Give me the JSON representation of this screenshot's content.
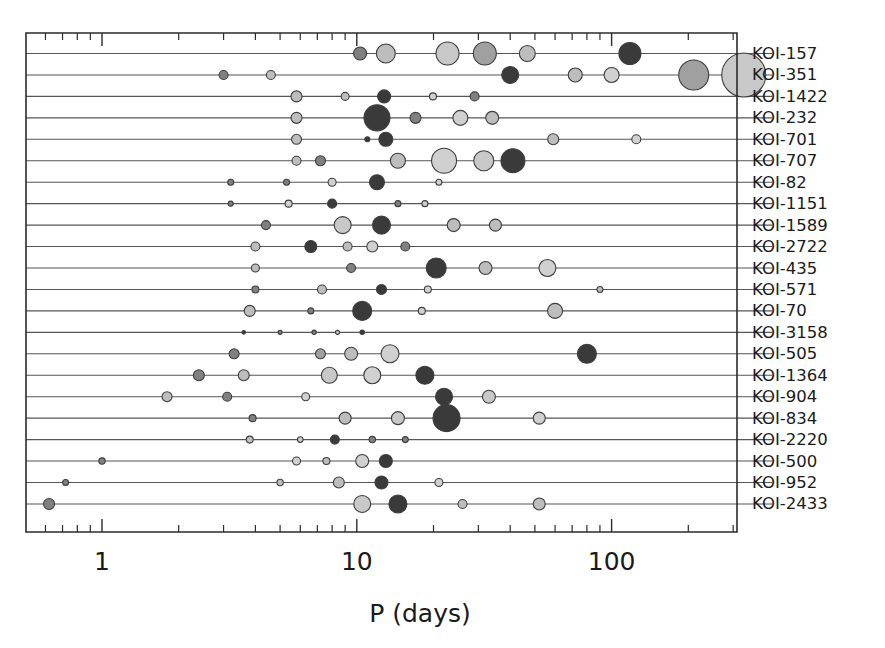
{
  "chart_data": {
    "type": "scatter",
    "title": "",
    "xlabel": "P (days)",
    "ylabel": "",
    "xscale": "log",
    "xlim": [
      0.55,
      1300
    ],
    "xticks": [
      1,
      10,
      100,
      1000
    ],
    "xticklabels": [
      "1",
      "10",
      "100",
      "1000"
    ],
    "grid": false,
    "legend": false,
    "marker_note": "Circle area scales with planet radius; fill gray level encodes planet radius class (light gray = large, dark = small/rocky).",
    "colors": {
      "axis": "#2b2b2b",
      "system_line": "#555555",
      "marker_edge": "#3d3d3d",
      "fill_light": "#d0d0d0",
      "fill_midlight": "#bdbdbd",
      "fill_mid": "#a0a0a0",
      "fill_middark": "#808080",
      "fill_dark": "#3a3a3a",
      "background": "#ffffff"
    },
    "categories": [
      "KOI-157",
      "KOI-351",
      "KOI-1422",
      "KOI-232",
      "KOI-701",
      "KOI-707",
      "KOI-82",
      "KOI-1151",
      "KOI-1589",
      "KOI-2722",
      "KOI-435",
      "KOI-571",
      "KOI-70",
      "KOI-3158",
      "KOI-505",
      "KOI-1364",
      "KOI-904",
      "KOI-834",
      "KOI-2220",
      "KOI-500",
      "KOI-952",
      "KOI-2433"
    ],
    "series": [
      {
        "name": "KOI-157",
        "planets": [
          {
            "P": 10.3,
            "r": 6.5,
            "fill": "#808080"
          },
          {
            "P": 13.0,
            "r": 9.5,
            "fill": "#bdbdbd"
          },
          {
            "P": 22.7,
            "r": 11.5,
            "fill": "#c8c8c8"
          },
          {
            "P": 31.8,
            "r": 11.5,
            "fill": "#a0a0a0"
          },
          {
            "P": 46.7,
            "r": 8.0,
            "fill": "#bdbdbd"
          },
          {
            "P": 118.0,
            "r": 11.0,
            "fill": "#3a3a3a"
          }
        ]
      },
      {
        "name": "KOI-351",
        "planets": [
          {
            "P": 3.0,
            "r": 4.5,
            "fill": "#808080"
          },
          {
            "P": 4.6,
            "r": 4.5,
            "fill": "#bdbdbd"
          },
          {
            "P": 40.0,
            "r": 8.5,
            "fill": "#3a3a3a"
          },
          {
            "P": 72.0,
            "r": 7.0,
            "fill": "#bdbdbd"
          },
          {
            "P": 100.0,
            "r": 7.5,
            "fill": "#d0d0d0"
          },
          {
            "P": 210.0,
            "r": 15.0,
            "fill": "#a0a0a0"
          },
          {
            "P": 330.0,
            "r": 22.0,
            "fill": "#c8c8c8"
          }
        ]
      },
      {
        "name": "KOI-1422",
        "planets": [
          {
            "P": 5.8,
            "r": 5.5,
            "fill": "#bdbdbd"
          },
          {
            "P": 9.0,
            "r": 4.0,
            "fill": "#bdbdbd"
          },
          {
            "P": 12.8,
            "r": 6.5,
            "fill": "#3a3a3a"
          },
          {
            "P": 19.9,
            "r": 3.5,
            "fill": "#d0d0d0"
          },
          {
            "P": 29.0,
            "r": 4.5,
            "fill": "#808080"
          }
        ]
      },
      {
        "name": "KOI-232",
        "planets": [
          {
            "P": 5.8,
            "r": 5.5,
            "fill": "#bdbdbd"
          },
          {
            "P": 12.0,
            "r": 13.0,
            "fill": "#3a3a3a"
          },
          {
            "P": 17.0,
            "r": 5.5,
            "fill": "#808080"
          },
          {
            "P": 25.5,
            "r": 7.5,
            "fill": "#d0d0d0"
          },
          {
            "P": 34.0,
            "r": 6.5,
            "fill": "#bdbdbd"
          }
        ]
      },
      {
        "name": "KOI-701",
        "planets": [
          {
            "P": 5.8,
            "r": 5.0,
            "fill": "#bdbdbd"
          },
          {
            "P": 11.0,
            "r": 2.5,
            "fill": "#3a3a3a"
          },
          {
            "P": 13.0,
            "r": 7.0,
            "fill": "#3a3a3a"
          },
          {
            "P": 59.0,
            "r": 5.5,
            "fill": "#bdbdbd"
          },
          {
            "P": 125.0,
            "r": 4.5,
            "fill": "#d0d0d0"
          }
        ]
      },
      {
        "name": "KOI-707",
        "planets": [
          {
            "P": 5.8,
            "r": 4.5,
            "fill": "#bdbdbd"
          },
          {
            "P": 7.2,
            "r": 5.0,
            "fill": "#808080"
          },
          {
            "P": 14.5,
            "r": 7.5,
            "fill": "#bdbdbd"
          },
          {
            "P": 22.0,
            "r": 12.5,
            "fill": "#d0d0d0"
          },
          {
            "P": 31.5,
            "r": 10.0,
            "fill": "#c8c8c8"
          },
          {
            "P": 41.0,
            "r": 12.0,
            "fill": "#3a3a3a"
          }
        ]
      },
      {
        "name": "KOI-82",
        "planets": [
          {
            "P": 3.2,
            "r": 3.0,
            "fill": "#808080"
          },
          {
            "P": 5.3,
            "r": 3.0,
            "fill": "#808080"
          },
          {
            "P": 8.0,
            "r": 4.0,
            "fill": "#d0d0d0"
          },
          {
            "P": 12.0,
            "r": 7.5,
            "fill": "#3a3a3a"
          },
          {
            "P": 21.0,
            "r": 3.0,
            "fill": "#d0d0d0"
          }
        ]
      },
      {
        "name": "KOI-1151",
        "planets": [
          {
            "P": 3.2,
            "r": 2.5,
            "fill": "#808080"
          },
          {
            "P": 5.4,
            "r": 3.5,
            "fill": "#d0d0d0"
          },
          {
            "P": 8.0,
            "r": 4.5,
            "fill": "#3a3a3a"
          },
          {
            "P": 14.5,
            "r": 3.0,
            "fill": "#808080"
          },
          {
            "P": 18.5,
            "r": 3.0,
            "fill": "#d0d0d0"
          }
        ]
      },
      {
        "name": "KOI-1589",
        "planets": [
          {
            "P": 4.4,
            "r": 4.5,
            "fill": "#808080"
          },
          {
            "P": 8.8,
            "r": 8.5,
            "fill": "#c8c8c8"
          },
          {
            "P": 12.5,
            "r": 9.0,
            "fill": "#3a3a3a"
          },
          {
            "P": 24.0,
            "r": 6.5,
            "fill": "#bdbdbd"
          },
          {
            "P": 35.0,
            "r": 6.0,
            "fill": "#bdbdbd"
          }
        ]
      },
      {
        "name": "KOI-2722",
        "planets": [
          {
            "P": 4.0,
            "r": 4.5,
            "fill": "#bdbdbd"
          },
          {
            "P": 6.6,
            "r": 6.0,
            "fill": "#3a3a3a"
          },
          {
            "P": 9.2,
            "r": 4.5,
            "fill": "#bdbdbd"
          },
          {
            "P": 11.5,
            "r": 5.5,
            "fill": "#d0d0d0"
          },
          {
            "P": 15.5,
            "r": 4.5,
            "fill": "#808080"
          }
        ]
      },
      {
        "name": "KOI-435",
        "planets": [
          {
            "P": 4.0,
            "r": 4.0,
            "fill": "#bdbdbd"
          },
          {
            "P": 9.5,
            "r": 4.5,
            "fill": "#808080"
          },
          {
            "P": 20.5,
            "r": 10.0,
            "fill": "#3a3a3a"
          },
          {
            "P": 32.0,
            "r": 6.5,
            "fill": "#bdbdbd"
          },
          {
            "P": 56.0,
            "r": 8.5,
            "fill": "#d0d0d0"
          }
        ]
      },
      {
        "name": "KOI-571",
        "planets": [
          {
            "P": 4.0,
            "r": 3.5,
            "fill": "#808080"
          },
          {
            "P": 7.3,
            "r": 4.5,
            "fill": "#bdbdbd"
          },
          {
            "P": 12.5,
            "r": 5.0,
            "fill": "#3a3a3a"
          },
          {
            "P": 19.0,
            "r": 3.5,
            "fill": "#d0d0d0"
          },
          {
            "P": 90.0,
            "r": 3.0,
            "fill": "#bdbdbd"
          }
        ]
      },
      {
        "name": "KOI-70",
        "planets": [
          {
            "P": 3.8,
            "r": 5.5,
            "fill": "#bdbdbd"
          },
          {
            "P": 6.6,
            "r": 3.0,
            "fill": "#808080"
          },
          {
            "P": 10.5,
            "r": 9.5,
            "fill": "#3a3a3a"
          },
          {
            "P": 18.0,
            "r": 3.5,
            "fill": "#d0d0d0"
          },
          {
            "P": 60.0,
            "r": 7.5,
            "fill": "#bdbdbd"
          }
        ]
      },
      {
        "name": "KOI-3158",
        "planets": [
          {
            "P": 3.6,
            "r": 1.8,
            "fill": "#3a3a3a"
          },
          {
            "P": 5.0,
            "r": 2.0,
            "fill": "#808080"
          },
          {
            "P": 6.8,
            "r": 2.2,
            "fill": "#808080"
          },
          {
            "P": 8.4,
            "r": 2.0,
            "fill": "#d0d0d0"
          },
          {
            "P": 10.5,
            "r": 2.2,
            "fill": "#3a3a3a"
          }
        ]
      },
      {
        "name": "KOI-505",
        "planets": [
          {
            "P": 3.3,
            "r": 5.0,
            "fill": "#808080"
          },
          {
            "P": 7.2,
            "r": 5.0,
            "fill": "#a0a0a0"
          },
          {
            "P": 9.5,
            "r": 6.5,
            "fill": "#bdbdbd"
          },
          {
            "P": 13.5,
            "r": 9.0,
            "fill": "#d0d0d0"
          },
          {
            "P": 80.0,
            "r": 9.5,
            "fill": "#3a3a3a"
          }
        ]
      },
      {
        "name": "KOI-1364",
        "planets": [
          {
            "P": 2.4,
            "r": 5.5,
            "fill": "#808080"
          },
          {
            "P": 3.6,
            "r": 5.5,
            "fill": "#bdbdbd"
          },
          {
            "P": 7.8,
            "r": 8.0,
            "fill": "#c8c8c8"
          },
          {
            "P": 11.5,
            "r": 8.5,
            "fill": "#d0d0d0"
          },
          {
            "P": 18.5,
            "r": 9.0,
            "fill": "#3a3a3a"
          }
        ]
      },
      {
        "name": "KOI-904",
        "planets": [
          {
            "P": 1.8,
            "r": 5.0,
            "fill": "#bdbdbd"
          },
          {
            "P": 3.1,
            "r": 4.5,
            "fill": "#808080"
          },
          {
            "P": 6.3,
            "r": 4.0,
            "fill": "#d0d0d0"
          },
          {
            "P": 22.0,
            "r": 8.5,
            "fill": "#3a3a3a"
          },
          {
            "P": 33.0,
            "r": 6.5,
            "fill": "#c8c8c8"
          }
        ]
      },
      {
        "name": "KOI-834",
        "planets": [
          {
            "P": 3.9,
            "r": 3.5,
            "fill": "#808080"
          },
          {
            "P": 9.0,
            "r": 6.0,
            "fill": "#bdbdbd"
          },
          {
            "P": 14.5,
            "r": 6.5,
            "fill": "#c8c8c8"
          },
          {
            "P": 22.5,
            "r": 13.5,
            "fill": "#3a3a3a"
          },
          {
            "P": 52.0,
            "r": 6.0,
            "fill": "#d0d0d0"
          }
        ]
      },
      {
        "name": "KOI-2220",
        "planets": [
          {
            "P": 3.8,
            "r": 3.5,
            "fill": "#bdbdbd"
          },
          {
            "P": 6.0,
            "r": 2.8,
            "fill": "#d0d0d0"
          },
          {
            "P": 8.2,
            "r": 4.5,
            "fill": "#3a3a3a"
          },
          {
            "P": 11.5,
            "r": 3.2,
            "fill": "#808080"
          },
          {
            "P": 15.5,
            "r": 3.0,
            "fill": "#808080"
          }
        ]
      },
      {
        "name": "KOI-500",
        "planets": [
          {
            "P": 1.0,
            "r": 3.2,
            "fill": "#808080"
          },
          {
            "P": 5.8,
            "r": 4.0,
            "fill": "#d0d0d0"
          },
          {
            "P": 7.6,
            "r": 3.5,
            "fill": "#bdbdbd"
          },
          {
            "P": 10.5,
            "r": 6.5,
            "fill": "#d0d0d0"
          },
          {
            "P": 13.0,
            "r": 6.5,
            "fill": "#3a3a3a"
          }
        ]
      },
      {
        "name": "KOI-952",
        "planets": [
          {
            "P": 0.72,
            "r": 3.0,
            "fill": "#808080"
          },
          {
            "P": 5.0,
            "r": 3.2,
            "fill": "#bdbdbd"
          },
          {
            "P": 8.5,
            "r": 5.5,
            "fill": "#bdbdbd"
          },
          {
            "P": 12.5,
            "r": 6.5,
            "fill": "#3a3a3a"
          },
          {
            "P": 21.0,
            "r": 4.0,
            "fill": "#d0d0d0"
          }
        ]
      },
      {
        "name": "KOI-2433",
        "planets": [
          {
            "P": 0.62,
            "r": 5.5,
            "fill": "#808080"
          },
          {
            "P": 10.5,
            "r": 8.5,
            "fill": "#c8c8c8"
          },
          {
            "P": 14.5,
            "r": 9.0,
            "fill": "#3a3a3a"
          },
          {
            "P": 26.0,
            "r": 4.5,
            "fill": "#bdbdbd"
          },
          {
            "P": 52.0,
            "r": 6.0,
            "fill": "#bdbdbd"
          }
        ]
      }
    ]
  }
}
